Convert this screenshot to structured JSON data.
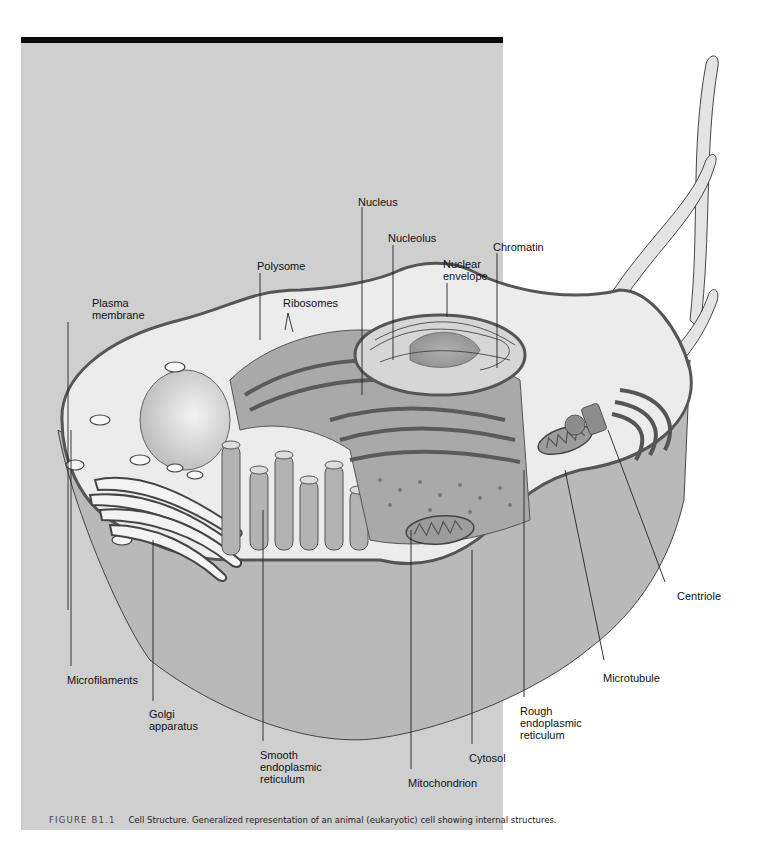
{
  "figure": {
    "number": "FIGURE B1.1",
    "caption": "Cell Structure. Generalized representation of an animal (eukaryotic) cell showing internal structures.",
    "colors": {
      "panel_background": "#cfcfcf",
      "top_rule": "#0a0a0a",
      "cytoplasm_light": "#ececec",
      "organelle_mid": "#a8a8a8",
      "membrane_dark": "#555555",
      "cut_face": "#b9b9b9"
    }
  },
  "labels": {
    "nucleus": "Nucleus",
    "nucleolus": "Nucleolus",
    "chromatin": "Chromatin",
    "polysome": "Polysome",
    "nuclear_envelope": "Nuclear\nenvelope",
    "plasma_membrane": "Plasma\nmembrane",
    "ribosomes": "Ribosomes",
    "centriole": "Centriole",
    "microfilaments": "Microfilaments",
    "microtubule": "Microtubule",
    "golgi_apparatus": "Golgi\napparatus",
    "rough_er": "Rough\nendoplasmic\nreticulum",
    "smooth_er": "Smooth\nendoplasmic\nreticulum",
    "cytosol": "Cytosol",
    "mitochondrion": "Mitochondrion"
  }
}
